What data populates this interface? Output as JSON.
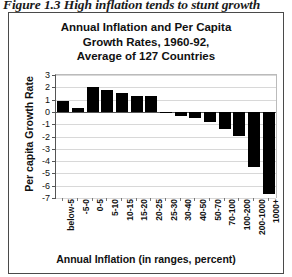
{
  "figure": {
    "caption": "Figure 1.3 High inflation tends to stunt growth"
  },
  "chart_data": {
    "type": "bar",
    "title": "Annual Inflation and Per Capita Growth Rates, 1960-92, Average of 127 Countries",
    "title_lines": [
      "Annual Inflation and Per Capita",
      "Growth Rates, 1960-92,",
      "Average of 127 Countries"
    ],
    "xlabel": "Annual Inflation (in ranges, percent)",
    "ylabel": "Per capita Growth Rate",
    "categories": [
      "below-5",
      "-5-0",
      "0-5",
      "5-10",
      "10-15",
      "15-20",
      "20-25",
      "25-30",
      "30-40",
      "40-50",
      "50-70",
      "70-100",
      "100-200",
      "200-1000",
      "1000+"
    ],
    "values": [
      0.9,
      0.35,
      2.0,
      1.75,
      1.55,
      1.3,
      1.3,
      -0.05,
      -0.35,
      -0.5,
      -0.8,
      -1.4,
      -2.0,
      -4.5,
      -6.7
    ],
    "ylim": [
      -7,
      3
    ],
    "ytick_labels": [
      "3",
      "2",
      "1",
      "0",
      "-1",
      "-2",
      "-3",
      "-4",
      "-5",
      "-6",
      "-7"
    ],
    "ytick_values": [
      3,
      2,
      1,
      0,
      -1,
      -2,
      -3,
      -4,
      -5,
      -6,
      -7
    ],
    "ystep": 1,
    "grid": true,
    "legend": "none",
    "bar_color": "#000000",
    "axis_color": "#555555"
  }
}
